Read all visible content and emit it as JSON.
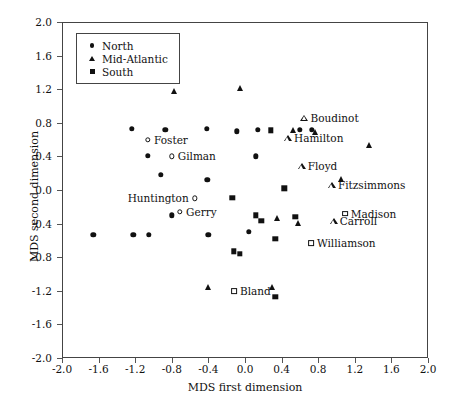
{
  "chart_data": {
    "type": "scatter",
    "title": "",
    "xlabel": "MDS first dimension",
    "ylabel": "MDS second dimension",
    "xlim": [
      -2.0,
      2.0
    ],
    "ylim": [
      -2.0,
      2.0
    ],
    "grid": false,
    "legend_position": "top-left",
    "xticks": [
      "-2.0",
      "-1.6",
      "-1.2",
      "-0.8",
      "-0.4",
      "0.0",
      "0.4",
      "0.8",
      "1.2",
      "1.6",
      "2.0"
    ],
    "yticks": [
      "2.0",
      "1.6",
      "1.2",
      "0.8",
      "0.4",
      "0.0",
      "-0.4",
      "-0.8",
      "-1.2",
      "-1.6",
      "-2.0"
    ],
    "xtick_values": [
      -2.0,
      -1.6,
      -1.2,
      -0.8,
      -0.4,
      0.0,
      0.4,
      0.8,
      1.2,
      1.6,
      2.0
    ],
    "ytick_values": [
      2.0,
      1.6,
      1.2,
      0.8,
      0.4,
      0.0,
      -0.4,
      -0.8,
      -1.2,
      -1.6,
      -2.0
    ],
    "legend": [
      {
        "name": "North",
        "marker": "circle"
      },
      {
        "name": "Mid-Atlantic",
        "marker": "triangle"
      },
      {
        "name": "South",
        "marker": "square"
      }
    ],
    "series": [
      {
        "name": "North",
        "marker": "circle",
        "points": [
          {
            "x": -1.66,
            "y": -0.53
          },
          {
            "x": -1.24,
            "y": 0.73
          },
          {
            "x": -1.22,
            "y": -0.53
          },
          {
            "x": -1.06,
            "y": 0.41
          },
          {
            "x": -1.05,
            "y": -0.53
          },
          {
            "x": -0.87,
            "y": 0.72
          },
          {
            "x": -0.92,
            "y": 0.18
          },
          {
            "x": -0.8,
            "y": -0.3
          },
          {
            "x": -0.42,
            "y": 0.73
          },
          {
            "x": -0.41,
            "y": 0.12
          },
          {
            "x": -0.4,
            "y": -0.53
          },
          {
            "x": -0.09,
            "y": 0.7
          },
          {
            "x": 0.14,
            "y": 0.72
          },
          {
            "x": 0.12,
            "y": 0.4
          },
          {
            "x": 0.04,
            "y": -0.5
          },
          {
            "x": 0.6,
            "y": 0.72
          },
          {
            "x": 0.73,
            "y": 0.72
          }
        ]
      },
      {
        "name": "North-labeled",
        "marker": "circle-open",
        "points": [
          {
            "x": -1.06,
            "y": 0.6,
            "label": "Foster",
            "label_side": "right"
          },
          {
            "x": -0.8,
            "y": 0.4,
            "label": "Gilman",
            "label_side": "right"
          },
          {
            "x": -0.55,
            "y": -0.1,
            "label": "Huntington",
            "label_side": "left"
          },
          {
            "x": -0.71,
            "y": -0.26,
            "label": "Gerry",
            "label_side": "right"
          }
        ]
      },
      {
        "name": "Mid-Atlantic",
        "marker": "triangle",
        "points": [
          {
            "x": -0.78,
            "y": 1.18
          },
          {
            "x": -0.06,
            "y": 1.21
          },
          {
            "x": 0.52,
            "y": 0.72
          },
          {
            "x": 0.77,
            "y": 0.69
          },
          {
            "x": 1.35,
            "y": 0.53
          },
          {
            "x": 1.05,
            "y": 0.13
          },
          {
            "x": 0.35,
            "y": -0.33
          },
          {
            "x": 0.58,
            "y": -0.39
          },
          {
            "x": 0.3,
            "y": -1.15
          },
          {
            "x": -0.4,
            "y": -1.16
          }
        ]
      },
      {
        "name": "Mid-Atlantic-labeled",
        "marker": "triangle-open",
        "points": [
          {
            "x": 0.65,
            "y": 0.86,
            "label": "Boudinot",
            "label_side": "right"
          },
          {
            "x": 0.47,
            "y": 0.62,
            "label": "Hamilton",
            "label_side": "right"
          },
          {
            "x": 0.62,
            "y": 0.28,
            "label": "Floyd",
            "label_side": "right"
          },
          {
            "x": 0.95,
            "y": 0.06,
            "label": "Fitzsimmons",
            "label_side": "right"
          },
          {
            "x": 0.97,
            "y": -0.37,
            "label": "Carroll",
            "label_side": "right"
          }
        ]
      },
      {
        "name": "South",
        "marker": "square",
        "points": [
          {
            "x": 0.28,
            "y": 0.71
          },
          {
            "x": 0.43,
            "y": 0.02
          },
          {
            "x": -0.14,
            "y": -0.09
          },
          {
            "x": 0.12,
            "y": -0.3
          },
          {
            "x": 0.18,
            "y": -0.37
          },
          {
            "x": 0.55,
            "y": -0.32
          },
          {
            "x": 0.33,
            "y": -0.58
          },
          {
            "x": -0.12,
            "y": -0.73
          },
          {
            "x": -0.06,
            "y": -0.76
          },
          {
            "x": 0.33,
            "y": -1.27
          }
        ]
      },
      {
        "name": "South-labeled",
        "marker": "square-open",
        "points": [
          {
            "x": 1.09,
            "y": -0.28,
            "label": "Madison",
            "label_side": "right"
          },
          {
            "x": 0.72,
            "y": -0.63,
            "label": "Williamson",
            "label_side": "right"
          },
          {
            "x": -0.12,
            "y": -1.2,
            "label": "Bland",
            "label_side": "right"
          }
        ]
      }
    ]
  }
}
